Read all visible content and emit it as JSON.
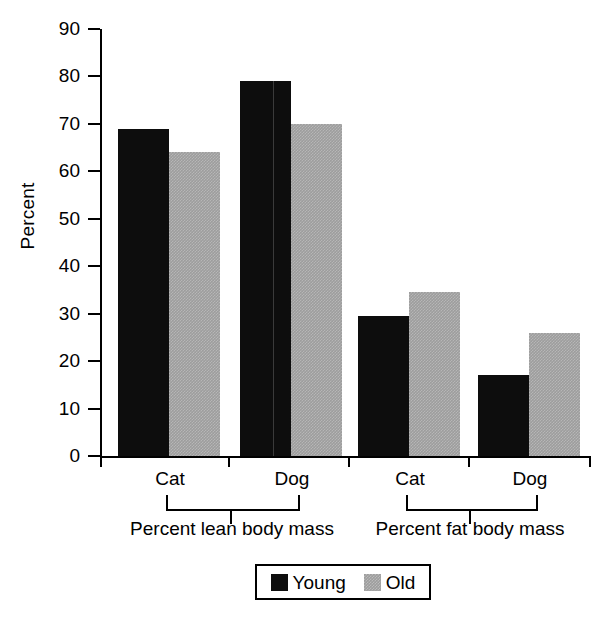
{
  "chart_data": {
    "type": "bar",
    "title": "",
    "xlabel": "",
    "ylabel": "Percent",
    "ylim": [
      0,
      90
    ],
    "ytick_labels": [
      "90",
      "80",
      "70",
      "60",
      "50",
      "40",
      "30",
      "20",
      "10",
      "0"
    ],
    "ytick_values": [
      90,
      80,
      70,
      60,
      50,
      40,
      30,
      20,
      10,
      0
    ],
    "grid": false,
    "legend_position": "bottom-center",
    "categories": [
      "Cat",
      "Dog",
      "Cat",
      "Dog"
    ],
    "groups": [
      {
        "label": "Percent lean body mass",
        "categories": [
          "Cat",
          "Dog"
        ]
      },
      {
        "label": "Percent fat body mass",
        "categories": [
          "Cat",
          "Dog"
        ]
      }
    ],
    "series": [
      {
        "name": "Young",
        "color": "#0d0d0d",
        "values": [
          69,
          79,
          29.5,
          17
        ]
      },
      {
        "name": "Old",
        "color": "#9d9d9d",
        "values": [
          64,
          70,
          34.5,
          26
        ]
      }
    ],
    "bars": [
      {
        "group": "Percent lean body mass",
        "category": "Cat",
        "series": "Young",
        "value": 69,
        "x": 16,
        "width": 51
      },
      {
        "group": "Percent lean body mass",
        "category": "Cat",
        "series": "Old",
        "value": 64,
        "x": 67,
        "width": 51
      },
      {
        "group": "Percent lean body mass",
        "category": "Dog",
        "series": "Young",
        "value": 79,
        "x": 138,
        "width": 51
      },
      {
        "group": "Percent lean body mass",
        "category": "Dog",
        "series": "Old",
        "value": 70,
        "x": 189,
        "width": 51
      },
      {
        "group": "Percent fat body mass",
        "category": "Cat",
        "series": "Young",
        "value": 29.5,
        "x": 256,
        "width": 51
      },
      {
        "group": "Percent fat body mass",
        "category": "Cat",
        "series": "Old",
        "value": 34.5,
        "x": 307,
        "width": 51
      },
      {
        "group": "Percent fat body mass",
        "category": "Dog",
        "series": "Young",
        "value": 17,
        "x": 376,
        "width": 51
      },
      {
        "group": "Percent fat body mass",
        "category": "Dog",
        "series": "Old",
        "value": 26,
        "x": 427,
        "width": 51
      }
    ]
  },
  "axis": {
    "y_title": "Percent"
  },
  "x_category_labels": [
    {
      "text": "Cat",
      "center": 170
    },
    {
      "text": "Dog",
      "center": 292
    },
    {
      "text": "Cat",
      "center": 410
    },
    {
      "text": "Dog",
      "center": 530
    }
  ],
  "group_labels": [
    {
      "text": "Percent lean body mass",
      "center": 232
    },
    {
      "text": "Percent fat body mass",
      "center": 470
    }
  ],
  "legend": {
    "items": [
      {
        "label": "Young",
        "swatch": "black-swatch-icon"
      },
      {
        "label": "Old",
        "swatch": "gray-swatch-icon"
      }
    ]
  }
}
